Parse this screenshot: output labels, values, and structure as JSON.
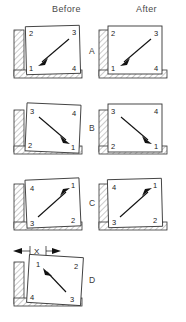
{
  "figure": {
    "background_color": "#ffffff",
    "line_color": "#333333",
    "hatch_color": "#888888",
    "arrow_color": "#111111"
  },
  "columns": {
    "before_label": "Before",
    "after_label": "After"
  },
  "rows": [
    {
      "letter": "A",
      "corner_labels": {
        "top_left": "2",
        "top_right": "3",
        "bottom_left": "1",
        "bottom_right": "4"
      },
      "arrow_direction": "down-left",
      "arrow_from_corner": "3",
      "arrow_to_corner": "1",
      "before_tilt_deg": -1.5,
      "after_tilt_deg": 0,
      "has_after": true,
      "dimension_label": ""
    },
    {
      "letter": "B",
      "corner_labels": {
        "top_left": "3",
        "top_right": "4",
        "bottom_left": "2",
        "bottom_right": "1"
      },
      "arrow_direction": "down-right",
      "arrow_from_corner": "3",
      "arrow_to_corner": "1",
      "before_tilt_deg": 2.5,
      "after_tilt_deg": 0,
      "has_after": true,
      "dimension_label": ""
    },
    {
      "letter": "C",
      "corner_labels": {
        "top_left": "4",
        "top_right": "1",
        "bottom_left": "3",
        "bottom_right": "2"
      },
      "arrow_direction": "up-right",
      "arrow_from_corner": "3",
      "arrow_to_corner": "1",
      "before_tilt_deg": -2.5,
      "after_tilt_deg": -1.5,
      "has_after": true,
      "dimension_label": ""
    },
    {
      "letter": "D",
      "corner_labels": {
        "top_left": "1",
        "top_right": "2",
        "bottom_left": "4",
        "bottom_right": "3"
      },
      "arrow_direction": "up-left",
      "arrow_from_corner": "3",
      "arrow_to_corner": "1",
      "before_tilt_deg": 3.5,
      "after_tilt_deg": 0,
      "has_after": false,
      "dimension_label": "X"
    }
  ]
}
